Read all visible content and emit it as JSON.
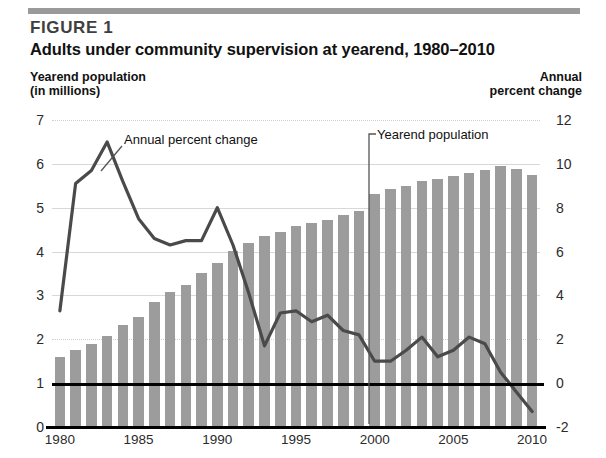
{
  "header": {
    "figure_label": "FIGURE 1",
    "title": "Adults under community supervision at yearend, 1980–2010",
    "left_axis_caption_line1": "Yearend population",
    "left_axis_caption_line2": "(in millions)",
    "right_axis_caption_line1": "Annual",
    "right_axis_caption_line2": "percent change"
  },
  "annotations": {
    "line_series_label": "Annual percent change",
    "bar_series_label": "Yearend population"
  },
  "colors": {
    "bar_fill": "#9c9c9c",
    "line_stroke": "#4a4a4a",
    "gridline": "#d8d8d8",
    "baseline": "#000000",
    "rule": "#9a9a9a",
    "text": "#111111"
  },
  "chart_data": {
    "type": "bar",
    "title": "Adults under community supervision at yearend, 1980–2010",
    "xlabel": "",
    "ylabel": "Yearend population (in millions)",
    "y2label": "Annual percent change",
    "ylim": [
      0,
      7
    ],
    "y2lim": [
      -2,
      12
    ],
    "yticks": [
      "0",
      "1",
      "2",
      "3",
      "4",
      "5",
      "6",
      "7"
    ],
    "y2ticks": [
      "-2",
      "0",
      "2",
      "4",
      "6",
      "8",
      "10",
      "12"
    ],
    "xticks": [
      "1980",
      "1985",
      "1990",
      "1995",
      "2000",
      "2005",
      "2010"
    ],
    "grid": true,
    "legend": "annotation-labels",
    "categories": [
      "1980",
      "1981",
      "1982",
      "1983",
      "1984",
      "1985",
      "1986",
      "1987",
      "1988",
      "1989",
      "1990",
      "1991",
      "1992",
      "1993",
      "1994",
      "1995",
      "1996",
      "1997",
      "1998",
      "1999",
      "2000",
      "2001",
      "2002",
      "2003",
      "2004",
      "2005",
      "2006",
      "2007",
      "2008",
      "2009",
      "2010"
    ],
    "series": [
      {
        "name": "Yearend population",
        "type": "bar",
        "axis": "left",
        "units": "millions",
        "values": [
          1.6,
          1.75,
          1.9,
          2.07,
          2.32,
          2.52,
          2.85,
          3.07,
          3.25,
          3.52,
          3.75,
          4.01,
          4.19,
          4.36,
          4.45,
          4.58,
          4.65,
          4.72,
          4.83,
          4.92,
          5.32,
          5.42,
          5.5,
          5.6,
          5.66,
          5.72,
          5.8,
          5.87,
          5.95,
          5.88,
          5.75
        ]
      },
      {
        "name": "Annual percent change",
        "type": "line",
        "axis": "right",
        "units": "percent",
        "values": [
          3.3,
          9.1,
          9.7,
          11.0,
          9.2,
          7.5,
          6.6,
          6.3,
          6.5,
          6.5,
          8.0,
          6.3,
          4.1,
          1.7,
          3.2,
          3.3,
          2.8,
          3.1,
          2.4,
          2.2,
          1.0,
          1.0,
          1.5,
          2.1,
          1.2,
          1.5,
          2.1,
          1.8,
          0.5,
          -0.4,
          -1.3
        ]
      }
    ]
  }
}
